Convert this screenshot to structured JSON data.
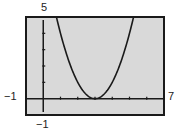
{
  "window": {
    "xmin_label": "−1",
    "xmax_label": "7",
    "ymax_label": "5",
    "ymin_label": "−1"
  },
  "chart_data": {
    "type": "line",
    "title": "",
    "xlabel": "",
    "ylabel": "",
    "xlim": [
      -1,
      7
    ],
    "ylim": [
      -1,
      5
    ],
    "xscale": 1,
    "yscale": 1,
    "grid": false,
    "function": "y = (x - 3)^2",
    "series": [
      {
        "name": "parabola",
        "x": [
          0.76,
          1,
          1.5,
          2,
          2.5,
          3,
          3.5,
          4,
          4.5,
          5,
          5.24
        ],
        "y": [
          5,
          4,
          2.25,
          1,
          0.25,
          0,
          0.25,
          1,
          2.25,
          4,
          5
        ]
      }
    ],
    "colors": {
      "screen": "#d9d9d9",
      "curve": "#1a1a1a",
      "frame": "#1a1a1a"
    }
  }
}
